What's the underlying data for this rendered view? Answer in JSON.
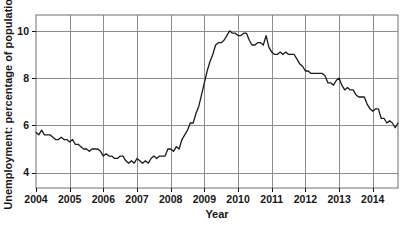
{
  "chart_data": {
    "type": "line",
    "title": "",
    "subtitle": "",
    "xlabel": "Year",
    "ylabel": "Unemployment: percentage of population",
    "xlim": [
      2004.0,
      2014.75
    ],
    "ylim": [
      3.35,
      10.67
    ],
    "xticks": [
      2004,
      2005,
      2006,
      2007,
      2008,
      2009,
      2010,
      2011,
      2012,
      2013,
      2014
    ],
    "xtick_labels": [
      "2004",
      "2005",
      "2006",
      "2007",
      "2008",
      "2009",
      "2010",
      "2011",
      "2012",
      "2013",
      "2014"
    ],
    "yticks": [
      4,
      6,
      8,
      10
    ],
    "ytick_labels": [
      "4",
      "6",
      "8",
      "10"
    ],
    "grid": "both",
    "grid_color": "#8c8c8c",
    "line_color": "#1a1a1a",
    "line_width": 1.3,
    "legend": "none",
    "annotations": [],
    "series": [
      {
        "name": "Unemployment rate",
        "units": "percentage of population",
        "x": [
          2004.0,
          2004.083,
          2004.167,
          2004.25,
          2004.333,
          2004.417,
          2004.5,
          2004.583,
          2004.667,
          2004.75,
          2004.833,
          2004.917,
          2005.0,
          2005.083,
          2005.167,
          2005.25,
          2005.333,
          2005.417,
          2005.5,
          2005.583,
          2005.667,
          2005.75,
          2005.833,
          2005.917,
          2006.0,
          2006.083,
          2006.167,
          2006.25,
          2006.333,
          2006.417,
          2006.5,
          2006.583,
          2006.667,
          2006.75,
          2006.833,
          2006.917,
          2007.0,
          2007.083,
          2007.167,
          2007.25,
          2007.333,
          2007.417,
          2007.5,
          2007.583,
          2007.667,
          2007.75,
          2007.833,
          2007.917,
          2008.0,
          2008.083,
          2008.167,
          2008.25,
          2008.333,
          2008.417,
          2008.5,
          2008.583,
          2008.667,
          2008.75,
          2008.833,
          2008.917,
          2009.0,
          2009.083,
          2009.167,
          2009.25,
          2009.333,
          2009.417,
          2009.5,
          2009.583,
          2009.667,
          2009.75,
          2009.833,
          2009.917,
          2010.0,
          2010.083,
          2010.167,
          2010.25,
          2010.333,
          2010.417,
          2010.5,
          2010.583,
          2010.667,
          2010.75,
          2010.833,
          2010.917,
          2011.0,
          2011.083,
          2011.167,
          2011.25,
          2011.333,
          2011.417,
          2011.5,
          2011.583,
          2011.667,
          2011.75,
          2011.833,
          2011.917,
          2012.0,
          2012.083,
          2012.167,
          2012.25,
          2012.333,
          2012.417,
          2012.5,
          2012.583,
          2012.667,
          2012.75,
          2012.833,
          2012.917,
          2013.0,
          2013.083,
          2013.167,
          2013.25,
          2013.333,
          2013.417,
          2013.5,
          2013.583,
          2013.667,
          2013.75,
          2013.833,
          2013.917,
          2014.0,
          2014.083,
          2014.167,
          2014.25,
          2014.333,
          2014.417,
          2014.5,
          2014.583,
          2014.667,
          2014.75
        ],
        "values": [
          5.7,
          5.6,
          5.8,
          5.6,
          5.6,
          5.6,
          5.5,
          5.4,
          5.4,
          5.5,
          5.4,
          5.4,
          5.3,
          5.4,
          5.2,
          5.2,
          5.1,
          5.0,
          5.0,
          4.9,
          5.0,
          5.0,
          5.0,
          4.9,
          4.7,
          4.8,
          4.7,
          4.7,
          4.6,
          4.6,
          4.7,
          4.7,
          4.5,
          4.4,
          4.5,
          4.4,
          4.6,
          4.5,
          4.4,
          4.5,
          4.4,
          4.6,
          4.7,
          4.6,
          4.7,
          4.7,
          4.7,
          5.0,
          5.0,
          4.9,
          5.1,
          5.0,
          5.4,
          5.6,
          5.8,
          6.1,
          6.1,
          6.5,
          6.8,
          7.3,
          7.8,
          8.3,
          8.7,
          9.0,
          9.4,
          9.5,
          9.5,
          9.6,
          9.8,
          10.0,
          9.9,
          9.9,
          9.8,
          9.8,
          9.9,
          9.9,
          9.6,
          9.4,
          9.4,
          9.5,
          9.5,
          9.4,
          9.8,
          9.3,
          9.1,
          9.0,
          9.0,
          9.1,
          9.0,
          9.1,
          9.0,
          9.0,
          9.0,
          8.8,
          8.6,
          8.5,
          8.3,
          8.3,
          8.2,
          8.2,
          8.2,
          8.2,
          8.2,
          8.1,
          7.8,
          7.8,
          7.7,
          7.9,
          8.0,
          7.7,
          7.5,
          7.6,
          7.5,
          7.5,
          7.3,
          7.2,
          7.2,
          7.2,
          6.9,
          6.7,
          6.6,
          6.7,
          6.7,
          6.3,
          6.3,
          6.1,
          6.2,
          6.1,
          5.9,
          6.1
        ]
      }
    ]
  }
}
